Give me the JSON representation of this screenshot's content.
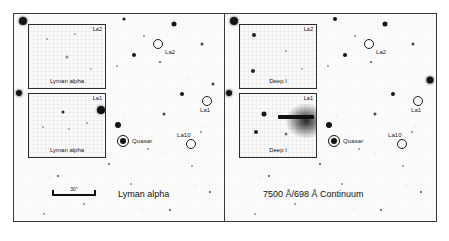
{
  "figure": {
    "background_color": "#ffffff",
    "frame_color": "#3a3a3a",
    "sky_color": "#fbfbfb",
    "ink_color": "#141414"
  },
  "panels": [
    {
      "id": "left",
      "caption": "Lyman alpha",
      "scalebar": {
        "label": "30\""
      },
      "markers": [
        {
          "name": "La2",
          "label": "La2",
          "type": "open-circle",
          "x": 68.5,
          "y": 14.5,
          "radius": 4.0,
          "label_dx": 6,
          "label_dy": 4
        },
        {
          "name": "La1",
          "label": "La1",
          "type": "open-circle",
          "x": 92.0,
          "y": 41.5,
          "radius": 4.0,
          "label_dx": -2,
          "label_dy": 6
        },
        {
          "name": "La10",
          "label": "La10",
          "type": "open-circle",
          "x": 84.0,
          "y": 62.0,
          "radius": 4.0,
          "label_dx": -9,
          "label_dy": -8
        },
        {
          "name": "Quasar",
          "label": "Quasar",
          "type": "quasar",
          "x": 52.0,
          "y": 60.5,
          "radius": 5.0,
          "label_dx": 7,
          "label_dy": -1
        }
      ],
      "insets": [
        {
          "name": "upper",
          "title": "La2",
          "caption": "Lyman alpha",
          "x": 7.0,
          "y": 5.0,
          "w": 37.0,
          "h": 31.0
        },
        {
          "name": "lower",
          "title": "La1",
          "caption": "Lyman alpha",
          "x": 7.0,
          "y": 38.0,
          "m": "",
          "w": 37.0,
          "h": 31.0
        }
      ]
    },
    {
      "id": "right",
      "caption": "7500 Å/698 Å Continuum",
      "markers": [
        {
          "name": "La2",
          "label": "La2",
          "type": "open-circle",
          "x": 68.5,
          "y": 14.5,
          "radius": 4.0,
          "label_dx": 6,
          "label_dy": 4
        },
        {
          "name": "La1",
          "label": "La1",
          "type": "open-circle",
          "x": 92.0,
          "y": 41.5,
          "radius": 4.0,
          "label_dx": -2,
          "label_dy": 6
        },
        {
          "name": "La10",
          "label": "La10",
          "type": "open-circle",
          "x": 84.0,
          "y": 62.0,
          "radius": 4.0,
          "label_dx": -9,
          "label_dy": -8
        },
        {
          "name": "Quasar",
          "label": "Quasar",
          "type": "quasar",
          "x": 52.0,
          "y": 60.5,
          "radius": 5.0,
          "label_dx": 7,
          "label_dy": -1
        }
      ],
      "insets": [
        {
          "name": "upper",
          "title": "La2",
          "caption": "Deep I",
          "x": 7.0,
          "y": 5.0,
          "w": 37.0,
          "h": 31.0
        },
        {
          "name": "lower",
          "title": "La1",
          "caption": "Deep I",
          "x": 7.0,
          "y": 38.0,
          "w": 37.0,
          "h": 31.0
        }
      ]
    }
  ]
}
